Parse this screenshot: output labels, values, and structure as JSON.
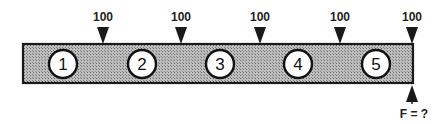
{
  "diagram": {
    "beam": {
      "fill": "#a8a8a8",
      "stroke": "#222222"
    },
    "nodes": [
      {
        "label": "1",
        "cx": 63
      },
      {
        "label": "2",
        "cx": 142
      },
      {
        "label": "3",
        "cx": 220
      },
      {
        "label": "4",
        "cx": 298
      },
      {
        "label": "5",
        "cx": 376
      }
    ],
    "loads": [
      {
        "label": "100",
        "x": 103
      },
      {
        "label": "100",
        "x": 181
      },
      {
        "label": "100",
        "x": 260
      },
      {
        "label": "100",
        "x": 340
      },
      {
        "label": "100",
        "x": 412
      }
    ],
    "reaction": {
      "label": "F = ?",
      "x": 412
    }
  }
}
